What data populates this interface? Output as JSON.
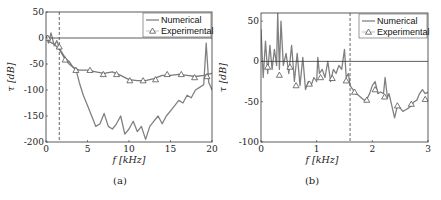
{
  "chart_data": [
    {
      "type": "line",
      "panel_label": "(a)",
      "xlabel": "f [kHz]",
      "ylabel": "τ [dB]",
      "xlim": [
        0,
        20
      ],
      "ylim": [
        -200,
        50
      ],
      "xticks": [
        0,
        5,
        10,
        15,
        20
      ],
      "yticks": [
        -200,
        -150,
        -100,
        -50,
        0,
        50
      ],
      "xtick_labels": [
        "0",
        "5",
        "10",
        "15",
        "20"
      ],
      "ytick_labels": [
        "-200",
        "-150",
        "-100",
        "-50",
        "0",
        "50"
      ],
      "hline": 0,
      "dashed_vline": 1.6,
      "legend": [
        "Numerical",
        "Experimental"
      ],
      "legend_position": "upper right",
      "series": [
        {
          "name": "Numerical",
          "style": "line",
          "color": "#808080",
          "x": [
            0,
            0.3,
            0.6,
            1.0,
            1.3,
            1.6,
            2.0,
            2.4,
            2.8,
            3.2,
            3.6,
            4.0,
            4.5,
            5.0,
            5.5,
            6.0,
            6.5,
            7.0,
            7.5,
            8.0,
            8.5,
            9.0,
            9.5,
            10.0,
            10.5,
            11.0,
            11.5,
            12.0,
            12.5,
            13.0,
            13.5,
            14.0,
            14.5,
            15.0,
            15.5,
            16.0,
            16.5,
            17.0,
            17.5,
            18.0,
            18.5,
            19.0,
            19.3,
            19.6,
            20.0
          ],
          "y": [
            5,
            -10,
            10,
            -15,
            -5,
            -20,
            -30,
            -40,
            -45,
            -55,
            -60,
            -85,
            -110,
            -130,
            -150,
            -170,
            -165,
            -145,
            -170,
            -175,
            -165,
            -150,
            -185,
            -175,
            -160,
            -180,
            -170,
            -195,
            -170,
            -160,
            -150,
            -165,
            -150,
            -140,
            -130,
            -120,
            -125,
            -110,
            -115,
            -100,
            -95,
            -90,
            -10,
            -85,
            -100
          ]
        },
        {
          "name": "Numerical (upper band)",
          "style": "line",
          "color": "#7a7a7a",
          "x": [
            0,
            0.5,
            1.0,
            1.6,
            2.2,
            2.8,
            3.4,
            4.0,
            5.0,
            6.0,
            7.0,
            8.0,
            9.0,
            10.0,
            11.0,
            12.0,
            13.0,
            14.0,
            15.0,
            16.0,
            17.0,
            18.0,
            19.0,
            20.0
          ],
          "y": [
            0,
            -8,
            -12,
            -22,
            -38,
            -50,
            -58,
            -62,
            -62,
            -65,
            -68,
            -65,
            -72,
            -80,
            -82,
            -82,
            -78,
            -72,
            -72,
            -70,
            -72,
            -74,
            -72,
            -68
          ]
        },
        {
          "name": "Experimental",
          "style": "marker",
          "marker": "triangle",
          "color": "#555555",
          "x": [
            0.2,
            1.6,
            2.3,
            3.6,
            5.3,
            6.9,
            8.5,
            10.1,
            11.7,
            13.2,
            14.6,
            16.3,
            17.9,
            19.4
          ],
          "y": [
            0,
            -17,
            -42,
            -62,
            -62,
            -70,
            -70,
            -82,
            -82,
            -80,
            -70,
            -70,
            -76,
            -74
          ]
        }
      ]
    },
    {
      "type": "line",
      "panel_label": "(b)",
      "xlabel": "f [kHz]",
      "ylabel": "τ [dB]",
      "xlim": [
        0,
        3
      ],
      "ylim": [
        -100,
        60
      ],
      "xticks": [
        0,
        1,
        2,
        3
      ],
      "yticks": [
        -100,
        -50,
        0,
        50
      ],
      "xtick_labels": [
        "0",
        "1",
        "2",
        "3"
      ],
      "ytick_labels": [
        "-100",
        "-50",
        "0",
        "50"
      ],
      "hline": 0,
      "dashed_vline": 1.6,
      "legend": [
        "Numerical",
        "Experimental"
      ],
      "legend_position": "upper right",
      "series": [
        {
          "name": "Numerical",
          "style": "line",
          "color": "#808080",
          "x": [
            0,
            0.04,
            0.08,
            0.12,
            0.16,
            0.2,
            0.24,
            0.28,
            0.3,
            0.33,
            0.36,
            0.4,
            0.45,
            0.5,
            0.55,
            0.6,
            0.65,
            0.7,
            0.75,
            0.8,
            0.85,
            0.9,
            0.95,
            1.0,
            1.02,
            1.05,
            1.1,
            1.15,
            1.2,
            1.25,
            1.3,
            1.35,
            1.4,
            1.45,
            1.5,
            1.53,
            1.57,
            1.6,
            1.65,
            1.7,
            1.75,
            1.8,
            1.85,
            1.9,
            1.95,
            2.0,
            2.05,
            2.1,
            2.15,
            2.2,
            2.23,
            2.27,
            2.3,
            2.35,
            2.4,
            2.45,
            2.5,
            2.55,
            2.6,
            2.65,
            2.7,
            2.75,
            2.8,
            2.85,
            2.9,
            2.95,
            3.0
          ],
          "y": [
            40,
            -20,
            25,
            -15,
            20,
            -10,
            15,
            -5,
            60,
            -10,
            50,
            -5,
            10,
            -15,
            20,
            -25,
            10,
            -30,
            5,
            -35,
            -25,
            -30,
            -20,
            -25,
            5,
            -15,
            -10,
            -20,
            0,
            -25,
            -10,
            -15,
            -5,
            -10,
            15,
            -20,
            -15,
            -30,
            -35,
            -40,
            -42,
            -45,
            -48,
            -47,
            -40,
            -30,
            -25,
            -40,
            -38,
            -40,
            -20,
            -45,
            -40,
            -55,
            -70,
            -55,
            -58,
            -62,
            -60,
            -58,
            -55,
            -50,
            -48,
            -40,
            -35,
            -40,
            -38
          ]
        },
        {
          "name": "Experimental",
          "style": "marker",
          "marker": "triangle",
          "color": "#555555",
          "x": [
            0.12,
            0.33,
            0.52,
            0.63,
            0.87,
            1.07,
            1.28,
            1.53,
            1.68,
            1.9,
            2.05,
            2.22,
            2.45,
            2.7,
            2.95
          ],
          "y": [
            -7,
            -17,
            -7,
            -30,
            -28,
            -20,
            -21,
            -24,
            -38,
            -48,
            -35,
            -44,
            -55,
            -53,
            -47
          ]
        }
      ]
    }
  ],
  "panels": [
    {
      "caption": "(a)",
      "xlabel": "f [kHz]",
      "ylabel": "τ [dB]",
      "legend_numerical": "Numerical",
      "legend_experimental": "Experimental"
    },
    {
      "caption": "(b)",
      "xlabel": "f [kHz]",
      "ylabel": "τ [dB]",
      "legend_numerical": "Numerical",
      "legend_experimental": "Experimental"
    }
  ]
}
